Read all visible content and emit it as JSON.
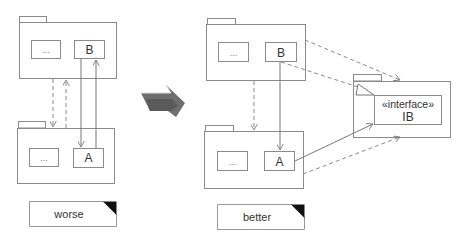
{
  "worse": {
    "top_package": {
      "elided_label": "...",
      "class_label": "B"
    },
    "bottom_package": {
      "elided_label": "...",
      "class_label": "A"
    },
    "note_label": "worse"
  },
  "better": {
    "top_package": {
      "elided_label": "...",
      "class_label": "B"
    },
    "bottom_package": {
      "elided_label": "...",
      "class_label": "A"
    },
    "interface_package": {
      "stereotype": "«interface»",
      "class_label": "IB"
    },
    "note_label": "better"
  },
  "transition_arrow": {
    "icon": "thick-arrow-right-icon",
    "color": "#6b6b6b"
  }
}
